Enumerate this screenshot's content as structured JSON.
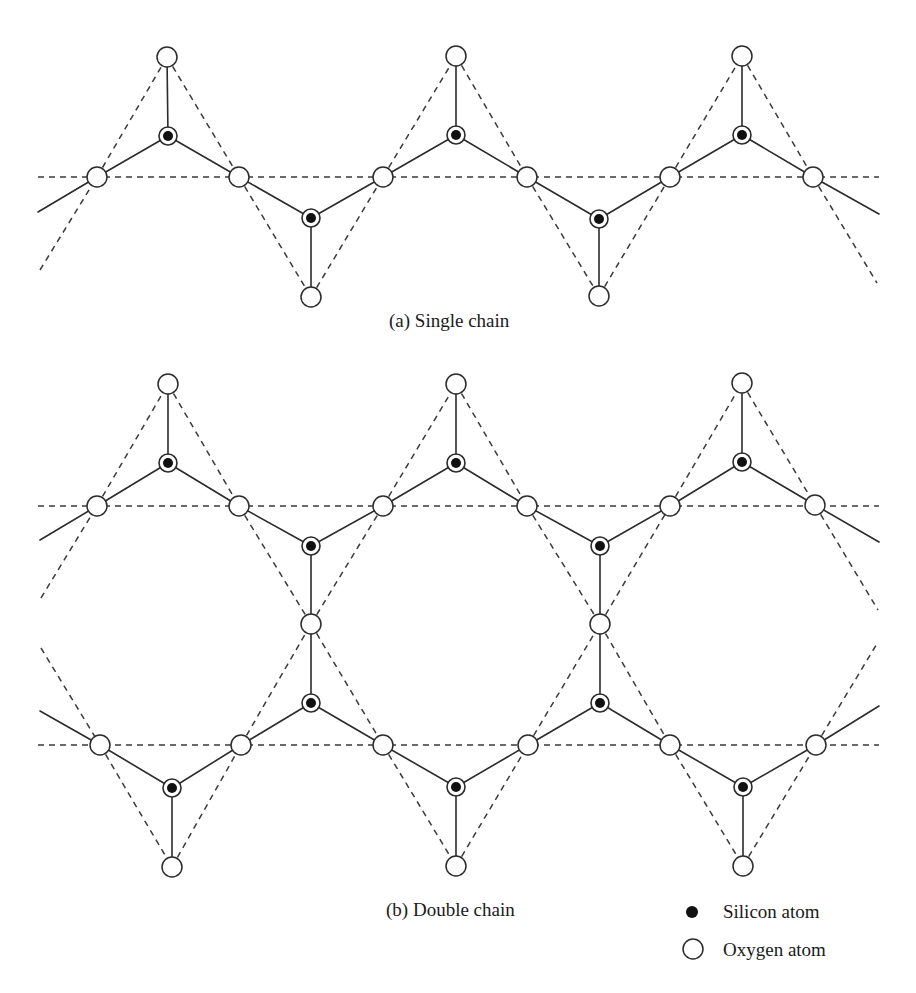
{
  "figure": {
    "width": 916,
    "height": 993,
    "colors": {
      "line": "#2b2b2b",
      "dash": "#3a3a3a",
      "silicon": "#111111",
      "oxygen_fill": "#ffffff"
    },
    "atom_sizes": {
      "oxygen_r": 10,
      "silicon_ring_r": 9,
      "silicon_core_r": 5
    }
  },
  "panels": [
    {
      "id": "a",
      "caption": "(a) Single chain",
      "caption_pos": [
        389,
        327
      ],
      "dashed_lines": [
        [
          38,
          177,
          879,
          177
        ],
        [
          40,
          270,
          97,
          177
        ],
        [
          97,
          177,
          167,
          57
        ],
        [
          167,
          57,
          239,
          177
        ],
        [
          239,
          177,
          311,
          297
        ],
        [
          311,
          297,
          383,
          177
        ],
        [
          383,
          177,
          456,
          56
        ],
        [
          456,
          56,
          527,
          177
        ],
        [
          527,
          177,
          599,
          296
        ],
        [
          599,
          296,
          670,
          177
        ],
        [
          670,
          177,
          742,
          56
        ],
        [
          742,
          56,
          813,
          177
        ],
        [
          813,
          177,
          877,
          283
        ]
      ],
      "bonds": [
        [
          38,
          212,
          97,
          177
        ],
        [
          97,
          177,
          168,
          136
        ],
        [
          168,
          136,
          239,
          177
        ],
        [
          168,
          136,
          167,
          57
        ],
        [
          239,
          177,
          311,
          218
        ],
        [
          311,
          218,
          383,
          177
        ],
        [
          311,
          218,
          311,
          297
        ],
        [
          383,
          177,
          456,
          135
        ],
        [
          456,
          135,
          527,
          177
        ],
        [
          456,
          135,
          456,
          56
        ],
        [
          527,
          177,
          599,
          219
        ],
        [
          599,
          219,
          670,
          177
        ],
        [
          599,
          219,
          599,
          296
        ],
        [
          670,
          177,
          742,
          135
        ],
        [
          742,
          135,
          813,
          177
        ],
        [
          742,
          135,
          742,
          56
        ],
        [
          813,
          177,
          879,
          214
        ]
      ],
      "oxygen": [
        [
          167,
          57
        ],
        [
          456,
          56
        ],
        [
          742,
          56
        ],
        [
          97,
          177
        ],
        [
          239,
          177
        ],
        [
          383,
          177
        ],
        [
          527,
          177
        ],
        [
          670,
          177
        ],
        [
          813,
          177
        ],
        [
          311,
          297
        ],
        [
          599,
          296
        ]
      ],
      "silicon": [
        [
          168,
          136
        ],
        [
          456,
          135
        ],
        [
          742,
          135
        ],
        [
          311,
          218
        ],
        [
          599,
          219
        ]
      ]
    },
    {
      "id": "b",
      "caption": "(b) Double chain",
      "caption_pos": [
        386,
        916
      ],
      "dashed_lines": [
        [
          38,
          506,
          879,
          506
        ],
        [
          38,
          745,
          879,
          745
        ],
        [
          41,
          598,
          97,
          506
        ],
        [
          97,
          506,
          168,
          384
        ],
        [
          168,
          384,
          239,
          506
        ],
        [
          239,
          506,
          311,
          624
        ],
        [
          311,
          624,
          383,
          506
        ],
        [
          383,
          506,
          456,
          384
        ],
        [
          456,
          384,
          527,
          506
        ],
        [
          527,
          506,
          600,
          624
        ],
        [
          600,
          624,
          670,
          506
        ],
        [
          670,
          506,
          742,
          383
        ],
        [
          742,
          383,
          815,
          505
        ],
        [
          815,
          505,
          878,
          610
        ],
        [
          41,
          648,
          100,
          745
        ],
        [
          100,
          745,
          172,
          867
        ],
        [
          172,
          867,
          241,
          745
        ],
        [
          241,
          745,
          311,
          624
        ],
        [
          311,
          624,
          383,
          745
        ],
        [
          383,
          745,
          456,
          866
        ],
        [
          456,
          866,
          528,
          745
        ],
        [
          528,
          745,
          600,
          624
        ],
        [
          600,
          624,
          670,
          745
        ],
        [
          670,
          745,
          743,
          866
        ],
        [
          743,
          866,
          816,
          745
        ],
        [
          816,
          745,
          878,
          642
        ]
      ],
      "bonds": [
        [
          40,
          540,
          97,
          506
        ],
        [
          97,
          506,
          168,
          463
        ],
        [
          168,
          463,
          239,
          506
        ],
        [
          168,
          463,
          168,
          384
        ],
        [
          239,
          506,
          311,
          546
        ],
        [
          311,
          546,
          383,
          506
        ],
        [
          311,
          546,
          311,
          624
        ],
        [
          383,
          506,
          456,
          463
        ],
        [
          456,
          463,
          527,
          506
        ],
        [
          456,
          463,
          456,
          384
        ],
        [
          527,
          506,
          600,
          546
        ],
        [
          600,
          546,
          670,
          506
        ],
        [
          600,
          546,
          600,
          624
        ],
        [
          670,
          506,
          742,
          462
        ],
        [
          742,
          462,
          815,
          505
        ],
        [
          742,
          462,
          742,
          383
        ],
        [
          815,
          505,
          879,
          542
        ],
        [
          40,
          711,
          100,
          745
        ],
        [
          100,
          745,
          172,
          788
        ],
        [
          172,
          788,
          241,
          745
        ],
        [
          172,
          788,
          172,
          867
        ],
        [
          241,
          745,
          311,
          703
        ],
        [
          311,
          703,
          383,
          745
        ],
        [
          311,
          703,
          311,
          624
        ],
        [
          383,
          745,
          456,
          787
        ],
        [
          456,
          787,
          528,
          745
        ],
        [
          456,
          787,
          456,
          866
        ],
        [
          528,
          745,
          600,
          703
        ],
        [
          600,
          703,
          670,
          745
        ],
        [
          600,
          703,
          600,
          624
        ],
        [
          670,
          745,
          743,
          787
        ],
        [
          743,
          787,
          816,
          745
        ],
        [
          743,
          787,
          743,
          866
        ],
        [
          816,
          745,
          879,
          706
        ]
      ],
      "oxygen": [
        [
          168,
          384
        ],
        [
          456,
          384
        ],
        [
          742,
          383
        ],
        [
          97,
          506
        ],
        [
          239,
          506
        ],
        [
          383,
          506
        ],
        [
          527,
          506
        ],
        [
          670,
          506
        ],
        [
          815,
          505
        ],
        [
          311,
          624
        ],
        [
          600,
          624
        ],
        [
          100,
          745
        ],
        [
          241,
          745
        ],
        [
          383,
          745
        ],
        [
          528,
          745
        ],
        [
          670,
          745
        ],
        [
          816,
          745
        ],
        [
          172,
          867
        ],
        [
          456,
          866
        ],
        [
          743,
          866
        ]
      ],
      "silicon": [
        [
          168,
          463
        ],
        [
          456,
          463
        ],
        [
          742,
          462
        ],
        [
          311,
          546
        ],
        [
          600,
          546
        ],
        [
          311,
          703
        ],
        [
          600,
          703
        ],
        [
          172,
          788
        ],
        [
          456,
          787
        ],
        [
          743,
          787
        ]
      ]
    }
  ],
  "legend": {
    "items": [
      {
        "symbol": "silicon",
        "label": "Silicon atom",
        "symbol_pos": [
          692,
          912
        ],
        "label_pos": [
          723,
          918
        ]
      },
      {
        "symbol": "oxygen",
        "label": "Oxygen atom",
        "symbol_pos": [
          693,
          949
        ],
        "label_pos": [
          723,
          956
        ]
      }
    ]
  }
}
